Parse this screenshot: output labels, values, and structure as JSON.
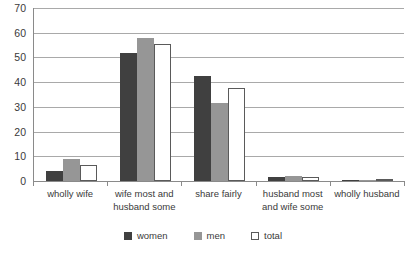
{
  "chart_data": {
    "type": "bar",
    "title": "",
    "xlabel": "",
    "ylabel": "",
    "ylim": [
      0,
      70
    ],
    "ytick_step": 10,
    "yticks": [
      70,
      60,
      50,
      40,
      30,
      20,
      10,
      0
    ],
    "grid": true,
    "legend_position": "bottom",
    "categories": [
      "wholly wife",
      "wife most and husband some",
      "share fairly",
      "husband most and wife some",
      "wholly husband"
    ],
    "category_lines": [
      [
        "wholly wife"
      ],
      [
        "wife most and",
        "husband some"
      ],
      [
        "share fairly"
      ],
      [
        "husband most",
        "and wife some"
      ],
      [
        "wholly husband"
      ]
    ],
    "series": [
      {
        "name": "women",
        "color": "#404040",
        "values": [
          4,
          52,
          42.5,
          1.8,
          0.4
        ]
      },
      {
        "name": "men",
        "color": "#969696",
        "values": [
          9,
          58,
          31.5,
          2,
          0.4
        ]
      },
      {
        "name": "total",
        "color": "#ffffff",
        "values": [
          6.5,
          55.5,
          37.5,
          1.5,
          0.4
        ]
      }
    ]
  },
  "legend": {
    "items": [
      {
        "label": "women",
        "swatch": "women"
      },
      {
        "label": "men",
        "swatch": "men"
      },
      {
        "label": "total",
        "swatch": "total"
      }
    ]
  },
  "colors": {
    "women": "#404040",
    "men": "#969696",
    "total": "#ffffff",
    "axis": "#8a8a8a",
    "gridline": "#a9a9a9",
    "text": "#3a3a3a",
    "background": "#ffffff"
  }
}
